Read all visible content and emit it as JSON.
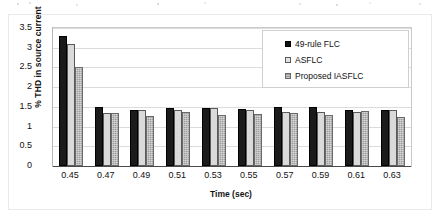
{
  "chart_data": {
    "type": "bar",
    "title": "",
    "xlabel": "Time (sec)",
    "ylabel": "% THD in source current",
    "categories": [
      "0.45",
      "0.47",
      "0.49",
      "0.51",
      "0.53",
      "0.55",
      "0.57",
      "0.59",
      "0.61",
      "0.63"
    ],
    "ylim": [
      0,
      3.5
    ],
    "yticks": [
      "0",
      "0.5",
      "1",
      "1.5",
      "2",
      "2.5",
      "3",
      "3.5"
    ],
    "ytick_values": [
      0,
      0.5,
      1,
      1.5,
      2,
      2.5,
      3,
      3.5
    ],
    "grid": true,
    "legend_position": "top-right",
    "series": [
      {
        "name": "49-rule FLC",
        "color": "#1b1b1b",
        "values": [
          3.3,
          1.5,
          1.41,
          1.46,
          1.48,
          1.45,
          1.5,
          1.49,
          1.43,
          1.43
        ]
      },
      {
        "name": "ASFLC",
        "color": "#dadada",
        "values": [
          3.1,
          1.35,
          1.42,
          1.42,
          1.46,
          1.43,
          1.37,
          1.36,
          1.38,
          1.43
        ]
      },
      {
        "name": "Proposed IASFLC",
        "color": "#9d9d9d",
        "values": [
          2.5,
          1.35,
          1.26,
          1.38,
          1.29,
          1.32,
          1.35,
          1.3,
          1.4,
          1.25
        ]
      }
    ]
  }
}
